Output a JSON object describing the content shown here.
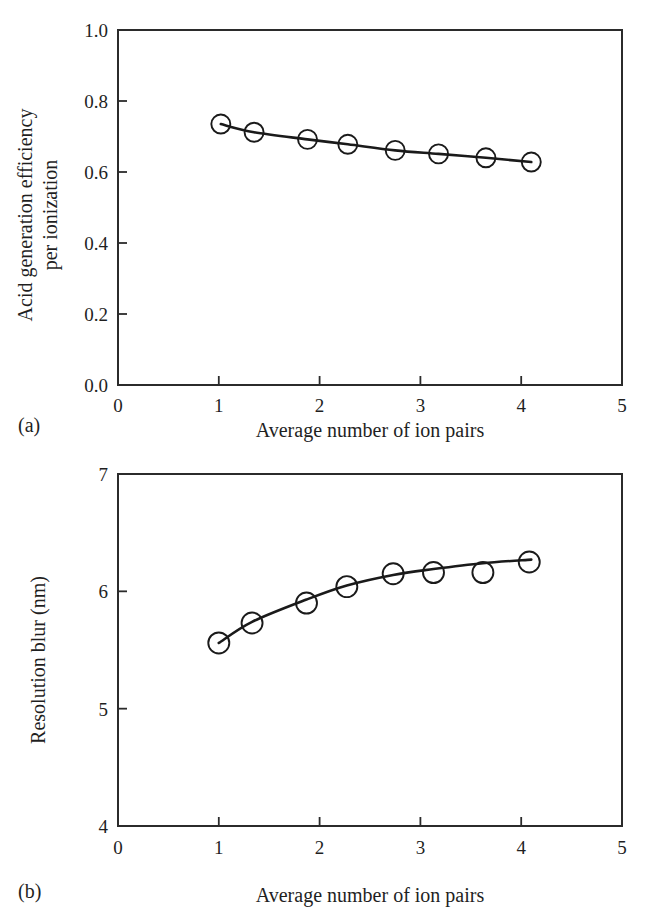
{
  "figure": {
    "panels": [
      {
        "id": "a",
        "panel_label": "(a)",
        "xlabel": "Average number of ion pairs",
        "ylabel_line1": "Acid generation efficiency",
        "ylabel_line2": "per ionization",
        "x_ticks": [
          "0",
          "1",
          "2",
          "3",
          "4",
          "5"
        ],
        "y_ticks": [
          "0.0",
          "0.2",
          "0.4",
          "0.6",
          "0.8",
          "1.0"
        ]
      },
      {
        "id": "b",
        "panel_label": "(b)",
        "xlabel": "Average number of ion pairs",
        "ylabel_line1": "Resolution blur (nm)",
        "ylabel_line2": "",
        "x_ticks": [
          "0",
          "1",
          "2",
          "3",
          "4",
          "5"
        ],
        "y_ticks": [
          "4",
          "5",
          "6",
          "7"
        ]
      }
    ]
  },
  "chart_data": [
    {
      "type": "line",
      "title": "",
      "panel": "(a)",
      "xlabel": "Average number of ion pairs",
      "ylabel": "Acid generation efficiency per ionization",
      "xlim": [
        0,
        5
      ],
      "ylim": [
        0.0,
        1.0
      ],
      "xticks": [
        0,
        1,
        2,
        3,
        4,
        5
      ],
      "yticks": [
        0.0,
        0.2,
        0.4,
        0.6,
        0.8,
        1.0
      ],
      "grid": false,
      "legend": "none",
      "marker": "open-circle",
      "x": [
        1.02,
        1.35,
        1.88,
        2.28,
        2.75,
        3.18,
        3.65,
        4.1
      ],
      "y": [
        0.735,
        0.712,
        0.692,
        0.678,
        0.661,
        0.651,
        0.64,
        0.628
      ]
    },
    {
      "type": "scatter",
      "title": "",
      "panel": "(b)",
      "xlabel": "Average number of ion pairs",
      "ylabel": "Resolution blur (nm)",
      "xlim": [
        0,
        5
      ],
      "ylim": [
        4,
        7
      ],
      "xticks": [
        0,
        1,
        2,
        3,
        4,
        5
      ],
      "yticks": [
        4,
        5,
        6,
        7
      ],
      "grid": false,
      "legend": "none",
      "marker": "open-circle",
      "x": [
        1.0,
        1.33,
        1.87,
        2.27,
        2.73,
        3.13,
        3.62,
        4.08
      ],
      "y": [
        5.56,
        5.73,
        5.9,
        6.04,
        6.15,
        6.16,
        6.16,
        6.25
      ],
      "fit_x": [
        1.0,
        1.33,
        1.87,
        2.27,
        2.73,
        3.13,
        3.62,
        4.1
      ],
      "fit_y": [
        5.56,
        5.74,
        5.93,
        6.05,
        6.14,
        6.19,
        6.24,
        6.27
      ]
    }
  ]
}
